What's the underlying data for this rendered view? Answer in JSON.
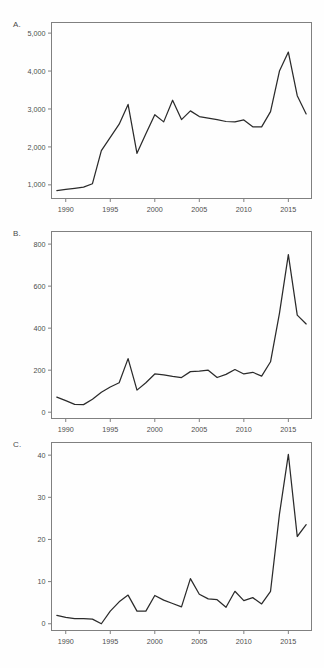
{
  "figure": {
    "panel_count": 3,
    "background_color": "#fefefe",
    "line_color": "#2b2b2b",
    "axis_color": "#808080"
  },
  "chart_data": [
    {
      "type": "line",
      "panel": "A.",
      "title": "",
      "xlabel": "",
      "ylabel": "",
      "grid": false,
      "legend": "none",
      "xlim": [
        1988.4,
        2017.6
      ],
      "ylim": [
        640,
        5280
      ],
      "xticks": [
        1990,
        1995,
        2000,
        2005,
        2010,
        2015
      ],
      "xticklabels": [
        "1990",
        "1995",
        "2000",
        "2005",
        "2010",
        "2015"
      ],
      "yticks": [
        1000,
        2000,
        3000,
        4000,
        5000
      ],
      "yticklabels": [
        "1,000",
        "2,000",
        "3,000",
        "4,000",
        "5,000"
      ],
      "x": [
        1989,
        1990,
        1991,
        1992,
        1993,
        1994,
        1995,
        1996,
        1997,
        1998,
        1999,
        2000,
        2001,
        2002,
        2003,
        2004,
        2005,
        2006,
        2007,
        2008,
        2009,
        2010,
        2011,
        2012,
        2013,
        2014,
        2015,
        2016,
        2017
      ],
      "values": [
        850,
        880,
        910,
        940,
        1030,
        1900,
        2250,
        2600,
        3120,
        1830,
        2350,
        2850,
        2660,
        3230,
        2720,
        2950,
        2800,
        2760,
        2720,
        2670,
        2660,
        2710,
        2530,
        2530,
        2930,
        4000,
        4500,
        3350,
        2870
      ]
    },
    {
      "type": "line",
      "panel": "B.",
      "title": "",
      "xlabel": "",
      "ylabel": "",
      "grid": false,
      "legend": "none",
      "xlim": [
        1988.4,
        2017.6
      ],
      "ylim": [
        -30,
        860
      ],
      "xticks": [
        1990,
        1995,
        2000,
        2005,
        2010,
        2015
      ],
      "xticklabels": [
        "1990",
        "1995",
        "2000",
        "2005",
        "2010",
        "2015"
      ],
      "yticks": [
        0,
        200,
        400,
        600,
        800
      ],
      "yticklabels": [
        "0",
        "200",
        "400",
        "600",
        "800"
      ],
      "x": [
        1989,
        1990,
        1991,
        1992,
        1993,
        1994,
        1995,
        1996,
        1997,
        1998,
        1999,
        2000,
        2001,
        2002,
        2003,
        2004,
        2005,
        2006,
        2007,
        2008,
        2009,
        2010,
        2011,
        2012,
        2013,
        2014,
        2015,
        2016,
        2017
      ],
      "values": [
        72,
        55,
        37,
        36,
        62,
        95,
        120,
        140,
        255,
        105,
        140,
        182,
        178,
        170,
        165,
        193,
        196,
        200,
        165,
        180,
        203,
        182,
        190,
        172,
        240,
        470,
        750,
        462,
        420
      ]
    },
    {
      "type": "line",
      "panel": "C.",
      "title": "",
      "xlabel": "",
      "ylabel": "",
      "grid": false,
      "legend": "none",
      "xlim": [
        1988.4,
        2017.6
      ],
      "ylim": [
        -1.6,
        43
      ],
      "xticks": [
        1990,
        1995,
        2000,
        2005,
        2010,
        2015
      ],
      "xticklabels": [
        "1990",
        "1995",
        "2000",
        "2005",
        "2010",
        "2015"
      ],
      "yticks": [
        0,
        10,
        20,
        30,
        40
      ],
      "yticklabels": [
        "0",
        "10",
        "20",
        "30",
        "40"
      ],
      "x": [
        1989,
        1990,
        1991,
        1992,
        1993,
        1994,
        1995,
        1996,
        1997,
        1998,
        1999,
        2000,
        2001,
        2002,
        2003,
        2004,
        2005,
        2006,
        2007,
        2008,
        2009,
        2010,
        2011,
        2012,
        2013,
        2014,
        2015,
        2016,
        2017
      ],
      "values": [
        2,
        1.5,
        1.2,
        1.2,
        1.1,
        0,
        3,
        5.2,
        6.8,
        3,
        3,
        6.7,
        5.6,
        4.8,
        4,
        10.7,
        7,
        5.9,
        5.7,
        3.9,
        7.7,
        5.5,
        6.2,
        4.7,
        7.7,
        26,
        40.2,
        20.7,
        23.5
      ]
    }
  ]
}
